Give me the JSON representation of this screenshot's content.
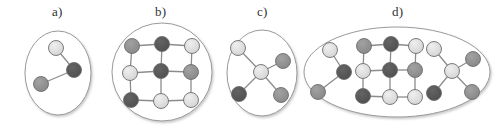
{
  "figure": {
    "background": "#ffffff",
    "width": 495,
    "height": 133
  },
  "palette": {
    "node_light": "#d9d9d9",
    "node_medium": "#909090",
    "node_dark": "#555555",
    "node_stroke": "#6e6e6e",
    "edge": "#8c8c8c",
    "ellipse_stroke": "#9a9a9a",
    "ellipse_fill": "#ffffff",
    "shadow": "#cfcfcf",
    "label_text": "#303030"
  },
  "panels": [
    {
      "id": "a",
      "label": "a)",
      "label_x": 52,
      "label_y": 4,
      "container": {
        "shape": "ellipse",
        "cx": 58,
        "cy": 73,
        "rx": 33,
        "ry": 42
      },
      "graph_type": "path-3",
      "nodes": [
        {
          "id": "a1",
          "x": 56,
          "y": 48,
          "tone": "light"
        },
        {
          "id": "a2",
          "x": 74,
          "y": 70,
          "tone": "dark"
        },
        {
          "id": "a3",
          "x": 41,
          "y": 84,
          "tone": "medium"
        }
      ],
      "edges": [
        [
          "a1",
          "a2"
        ],
        [
          "a2",
          "a3"
        ]
      ]
    },
    {
      "id": "b",
      "label": "b)",
      "label_x": 155,
      "label_y": 4,
      "container": {
        "shape": "ellipse",
        "cx": 162,
        "cy": 72,
        "rx": 50,
        "ry": 49
      },
      "graph_type": "grid-3x3",
      "nodes": [
        {
          "id": "b11",
          "x": 132,
          "y": 46,
          "tone": "medium"
        },
        {
          "id": "b12",
          "x": 162,
          "y": 44,
          "tone": "dark"
        },
        {
          "id": "b13",
          "x": 192,
          "y": 46,
          "tone": "light"
        },
        {
          "id": "b21",
          "x": 130,
          "y": 73,
          "tone": "light"
        },
        {
          "id": "b22",
          "x": 161,
          "y": 71,
          "tone": "dark"
        },
        {
          "id": "b23",
          "x": 191,
          "y": 72,
          "tone": "medium"
        },
        {
          "id": "b31",
          "x": 131,
          "y": 100,
          "tone": "dark"
        },
        {
          "id": "b32",
          "x": 161,
          "y": 101,
          "tone": "light"
        },
        {
          "id": "b33",
          "x": 191,
          "y": 100,
          "tone": "light"
        }
      ],
      "edges": [
        [
          "b11",
          "b12"
        ],
        [
          "b12",
          "b13"
        ],
        [
          "b21",
          "b22"
        ],
        [
          "b22",
          "b23"
        ],
        [
          "b31",
          "b32"
        ],
        [
          "b32",
          "b33"
        ],
        [
          "b11",
          "b21"
        ],
        [
          "b21",
          "b31"
        ],
        [
          "b12",
          "b22"
        ],
        [
          "b22",
          "b32"
        ],
        [
          "b13",
          "b23"
        ],
        [
          "b23",
          "b33"
        ]
      ]
    },
    {
      "id": "c",
      "label": "c)",
      "label_x": 257,
      "label_y": 4,
      "container": {
        "shape": "ellipse",
        "cx": 262,
        "cy": 73,
        "rx": 35,
        "ry": 43
      },
      "graph_type": "star-5",
      "nodes": [
        {
          "id": "c0",
          "x": 261,
          "y": 72,
          "tone": "light"
        },
        {
          "id": "c1",
          "x": 238,
          "y": 48,
          "tone": "light"
        },
        {
          "id": "c2",
          "x": 283,
          "y": 61,
          "tone": "medium"
        },
        {
          "id": "c3",
          "x": 239,
          "y": 94,
          "tone": "dark"
        },
        {
          "id": "c4",
          "x": 281,
          "y": 95,
          "tone": "medium"
        }
      ],
      "edges": [
        [
          "c0",
          "c1"
        ],
        [
          "c0",
          "c2"
        ],
        [
          "c0",
          "c3"
        ],
        [
          "c0",
          "c4"
        ]
      ]
    },
    {
      "id": "d",
      "label": "d)",
      "label_x": 392,
      "label_y": 4,
      "container": {
        "shape": "ellipse",
        "cx": 397,
        "cy": 72,
        "rx": 93,
        "ry": 45
      },
      "graph_type": "union-of-a-b-c",
      "nodes": [
        {
          "id": "d_a1",
          "x": 330,
          "y": 50,
          "tone": "light"
        },
        {
          "id": "d_a2",
          "x": 344,
          "y": 72,
          "tone": "dark"
        },
        {
          "id": "d_a3",
          "x": 318,
          "y": 92,
          "tone": "medium"
        },
        {
          "id": "d_b11",
          "x": 364,
          "y": 46,
          "tone": "medium"
        },
        {
          "id": "d_b12",
          "x": 391,
          "y": 44,
          "tone": "dark"
        },
        {
          "id": "d_b13",
          "x": 416,
          "y": 46,
          "tone": "light"
        },
        {
          "id": "d_b21",
          "x": 363,
          "y": 71,
          "tone": "light"
        },
        {
          "id": "d_b22",
          "x": 390,
          "y": 70,
          "tone": "dark"
        },
        {
          "id": "d_b23",
          "x": 415,
          "y": 70,
          "tone": "medium"
        },
        {
          "id": "d_b31",
          "x": 363,
          "y": 96,
          "tone": "dark"
        },
        {
          "id": "d_b32",
          "x": 390,
          "y": 97,
          "tone": "light"
        },
        {
          "id": "d_b33",
          "x": 415,
          "y": 97,
          "tone": "light"
        },
        {
          "id": "d_c0",
          "x": 452,
          "y": 71,
          "tone": "light"
        },
        {
          "id": "d_c1",
          "x": 434,
          "y": 49,
          "tone": "light"
        },
        {
          "id": "d_c2",
          "x": 473,
          "y": 59,
          "tone": "medium"
        },
        {
          "id": "d_c3",
          "x": 434,
          "y": 93,
          "tone": "dark"
        },
        {
          "id": "d_c4",
          "x": 472,
          "y": 92,
          "tone": "medium"
        }
      ],
      "edges": [
        [
          "d_a1",
          "d_a2"
        ],
        [
          "d_a2",
          "d_a3"
        ],
        [
          "d_b11",
          "d_b12"
        ],
        [
          "d_b12",
          "d_b13"
        ],
        [
          "d_b21",
          "d_b22"
        ],
        [
          "d_b22",
          "d_b23"
        ],
        [
          "d_b31",
          "d_b32"
        ],
        [
          "d_b32",
          "d_b33"
        ],
        [
          "d_b11",
          "d_b21"
        ],
        [
          "d_b21",
          "d_b31"
        ],
        [
          "d_b12",
          "d_b22"
        ],
        [
          "d_b22",
          "d_b32"
        ],
        [
          "d_b13",
          "d_b23"
        ],
        [
          "d_b23",
          "d_b33"
        ],
        [
          "d_c0",
          "d_c1"
        ],
        [
          "d_c0",
          "d_c2"
        ],
        [
          "d_c0",
          "d_c3"
        ],
        [
          "d_c0",
          "d_c4"
        ]
      ]
    }
  ],
  "node_radius": 7.5
}
